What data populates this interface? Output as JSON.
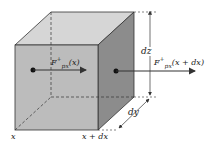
{
  "diagram": {
    "type": "control-volume-cube",
    "colors": {
      "front_face": "#bcbcbc",
      "top_face": "#d6d6d6",
      "right_face": "#8c8c8c",
      "edges": "#333333",
      "arrows": "#333333"
    },
    "labels": {
      "flux_in": {
        "base": "F",
        "sup": "+",
        "sub": "px",
        "arg": "(x)"
      },
      "flux_out": {
        "base": "F",
        "sup": "+",
        "sub": "px",
        "arg": "(x + dx)"
      },
      "dz": "dz",
      "dy": "dy",
      "x": "x",
      "x_plus_dx": "x + dx"
    }
  }
}
